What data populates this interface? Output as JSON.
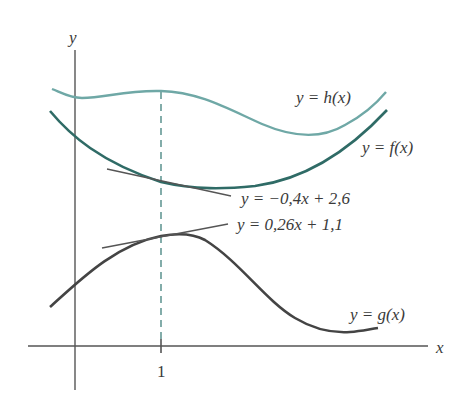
{
  "diagram": {
    "axes": {
      "x_label": "x",
      "y_label": "y",
      "tick_label": "1"
    },
    "curves": {
      "h": {
        "label": "y = h(x)",
        "color": "#6fa8a6"
      },
      "f": {
        "label": "y = f(x)",
        "color": "#2f6b66"
      },
      "g": {
        "label": "y = g(x)",
        "color": "#444444"
      }
    },
    "tangents": {
      "f_tangent": {
        "label": "y = −0,4x + 2,6",
        "color": "#555555"
      },
      "g_tangent": {
        "label": "y = 0,26x + 1,1",
        "color": "#555555"
      }
    },
    "guide": {
      "x_value": "1",
      "style": "dashed",
      "color": "#4f8a86"
    },
    "axis_color": "#555555"
  }
}
